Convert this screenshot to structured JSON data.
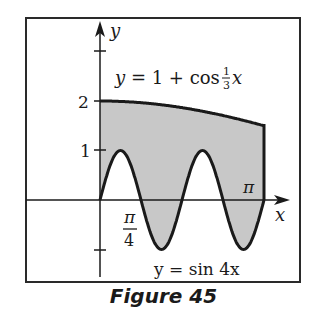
{
  "figure": {
    "caption": "Figure 45",
    "axes": {
      "x_label": "x",
      "y_label": "y"
    },
    "y_ticks": [
      {
        "value": 2,
        "label": "2"
      },
      {
        "value": 1,
        "label": "1"
      },
      {
        "value": -1,
        "label": ""
      },
      {
        "value": 3,
        "label": ""
      }
    ],
    "x_tick_labels": {
      "pi_over_4_num": "π",
      "pi_over_4_den": "4",
      "pi": "π"
    },
    "curves": {
      "upper": {
        "lhs": "y = 1 + cos ",
        "frac_num": "1",
        "frac_den": "3",
        "var": "x"
      },
      "lower": {
        "label": "y = sin 4x"
      }
    },
    "colors": {
      "shade": "#c8c8c8",
      "ink": "#1a1a1a",
      "frame": "#2a2a2a"
    }
  },
  "chart_data": {
    "type": "area",
    "title": "",
    "xlabel": "x",
    "ylabel": "y",
    "series": [
      {
        "name": "y = 1 + cos(x/3)",
        "x": [
          0,
          0.785,
          1.571,
          2.356,
          3.1416
        ],
        "values": [
          2.0,
          1.966,
          1.866,
          1.707,
          1.5
        ]
      },
      {
        "name": "y = sin 4x",
        "x": [
          0,
          0.196,
          0.393,
          0.589,
          0.785,
          0.982,
          1.178,
          1.374,
          1.571,
          1.767,
          1.963,
          2.16,
          2.356,
          2.553,
          2.749,
          2.945,
          3.1416
        ],
        "values": [
          0,
          0.707,
          1,
          0.707,
          0,
          -0.707,
          -1,
          -0.707,
          0,
          0.707,
          1,
          0.707,
          0,
          -0.707,
          -1,
          -0.707,
          0
        ]
      }
    ],
    "shaded_region": "between y = 1 + cos(x/3) and y = sin 4x for 0 ≤ x ≤ π",
    "xlim": [
      0,
      3.1416
    ],
    "ylim": [
      -1,
      3
    ],
    "x_tick_labels": [
      "π/4",
      "π"
    ],
    "y_tick_labels": [
      "1",
      "2"
    ],
    "grid": false,
    "legend": "none"
  }
}
